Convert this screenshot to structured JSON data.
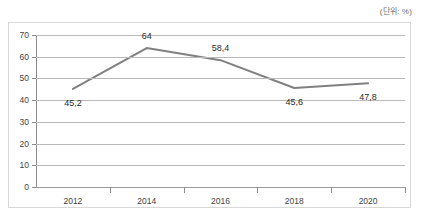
{
  "unit_note": "(단위: %)",
  "chart_data": {
    "type": "line",
    "title": "",
    "subtitle": "",
    "xlabel": "",
    "ylabel": "",
    "unit": "%",
    "unit_note": "(단위: %)",
    "categories": [
      "2012",
      "2014",
      "2016",
      "2018",
      "2020"
    ],
    "values": [
      45.2,
      64,
      58.4,
      45.6,
      47.8
    ],
    "point_labels": [
      "45,2",
      "64",
      "58,4",
      "45,6",
      "47,8"
    ],
    "series": [
      {
        "name": "",
        "values": [
          45.2,
          64,
          58.4,
          45.6,
          47.8
        ],
        "color": "#808080"
      }
    ],
    "ylim": [
      0,
      70
    ],
    "ytick_values": [
      0,
      10,
      20,
      30,
      40,
      50,
      60,
      70
    ],
    "ytick_labels": [
      "0",
      "10",
      "20",
      "30",
      "40",
      "50",
      "60",
      "70"
    ],
    "grid": true,
    "grid_axis": "y",
    "legend": false,
    "legend_position": "none",
    "markers": false,
    "line_color": "#808080",
    "line_width": 2,
    "label_positions": [
      "below",
      "above",
      "above",
      "below",
      "below"
    ]
  }
}
